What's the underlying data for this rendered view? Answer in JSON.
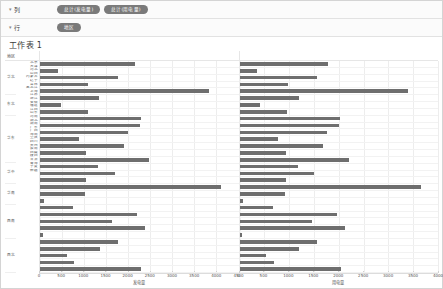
{
  "shelves": {
    "columns": {
      "label": "列",
      "caret": "▾",
      "pills": [
        "总计(发电量)",
        "总计(用电量)"
      ]
    },
    "rows": {
      "label": "行",
      "caret": "▾",
      "pills": [
        "地区"
      ]
    }
  },
  "worksheet": {
    "title": "工作表 1"
  },
  "headers": {
    "region_col": "地区",
    "province_col": "省份"
  },
  "colors": {
    "bar": "#6e6e6e",
    "pill": "#7a7a7a",
    "grid": "#ededed"
  },
  "chart_data": [
    {
      "type": "bar",
      "orientation": "horizontal",
      "title": "",
      "xlabel": "发电量",
      "ylabel": "",
      "xlim": [
        0,
        4500
      ],
      "xticks": [
        0,
        500,
        1000,
        1500,
        2000,
        2500,
        3000,
        3500,
        4000,
        4500
      ],
      "grid": true,
      "legend": "none",
      "categories": [
        "北京",
        "天津",
        "河北",
        "山西",
        "内蒙古",
        "辽宁",
        "吉林",
        "黑龙江",
        "上海",
        "江苏",
        "浙江",
        "安徽",
        "福建",
        "江西",
        "山东",
        "河南",
        "湖北",
        "湖南",
        "广东",
        "广西",
        "海南",
        "重庆",
        "四川",
        "贵州",
        "云南",
        "西藏",
        "陕西",
        "甘肃",
        "青海",
        "宁夏",
        "新疆"
      ],
      "values": [
        2150,
        410,
        1760,
        1090,
        3820,
        1330,
        470,
        1080,
        2280,
        2260,
        1990,
        880,
        1900,
        1050,
        2480,
        1310,
        1690,
        1050,
        4100,
        1030,
        90,
        750,
        2200,
        1640,
        2380,
        70,
        1760,
        1350,
        610,
        780,
        2300
      ]
    },
    {
      "type": "bar",
      "orientation": "horizontal",
      "title": "",
      "xlabel": "用电量",
      "ylabel": "",
      "xlim": [
        0,
        4000
      ],
      "xticks": [
        0,
        500,
        1000,
        1500,
        2000,
        2500,
        3000,
        3500,
        4000
      ],
      "grid": true,
      "legend": "none",
      "categories": [
        "北京",
        "天津",
        "河北",
        "山西",
        "内蒙古",
        "辽宁",
        "吉林",
        "黑龙江",
        "上海",
        "江苏",
        "浙江",
        "安徽",
        "福建",
        "江西",
        "山东",
        "河南",
        "湖北",
        "湖南",
        "广东",
        "广西",
        "海南",
        "重庆",
        "四川",
        "贵州",
        "云南",
        "西藏",
        "陕西",
        "甘肃",
        "青海",
        "宁夏",
        "新疆"
      ],
      "values": [
        1780,
        360,
        1570,
        970,
        3400,
        1190,
        420,
        960,
        2030,
        2010,
        1770,
        780,
        1690,
        930,
        2210,
        1170,
        1500,
        930,
        3650,
        920,
        80,
        670,
        1960,
        1460,
        2120,
        60,
        1570,
        1200,
        540,
        700,
        2050
      ]
    }
  ],
  "region_groups": [
    {
      "name": "华北",
      "count": 5
    },
    {
      "name": "东北",
      "count": 3
    },
    {
      "name": "华东",
      "count": 7
    },
    {
      "name": "华中",
      "count": 3
    },
    {
      "name": "华南",
      "count": 3
    },
    {
      "name": "西南",
      "count": 5
    },
    {
      "name": "西北",
      "count": 5
    }
  ]
}
